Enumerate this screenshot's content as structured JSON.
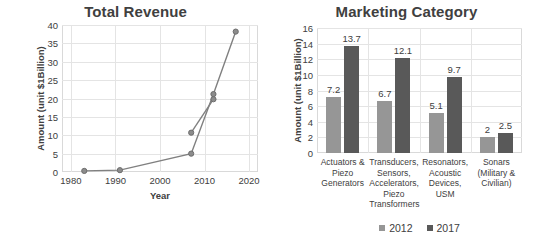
{
  "chart_data": [
    {
      "type": "line",
      "title": "Total Revenue",
      "xlabel": "Year",
      "ylabel": "Amount (unit $1Billion)",
      "xlim": [
        1978,
        2022
      ],
      "ylim": [
        0,
        40
      ],
      "yticks": [
        0,
        5,
        10,
        15,
        20,
        25,
        30,
        35,
        40
      ],
      "xticks": [
        1980,
        1990,
        2000,
        2010,
        2020
      ],
      "grid": true,
      "legend": "none",
      "marker": "circle",
      "line_color": "#808080",
      "series": [
        {
          "name": "series-1",
          "points": [
            {
              "x": 1983,
              "y": 0.3
            },
            {
              "x": 1991,
              "y": 0.5
            },
            {
              "x": 2007,
              "y": 5.0
            },
            {
              "x": 2012,
              "y": 21.2
            },
            {
              "x": 2017,
              "y": 38.2
            }
          ]
        },
        {
          "name": "series-2",
          "points": [
            {
              "x": 2007,
              "y": 10.7
            },
            {
              "x": 2012,
              "y": 19.8
            }
          ]
        }
      ]
    },
    {
      "type": "bar",
      "title": "Marketing Category",
      "xlabel": "",
      "ylabel": "Amount (unit $1Billion)",
      "ylim": [
        0,
        16
      ],
      "yticks": [
        0,
        2,
        4,
        6,
        8,
        10,
        12,
        14,
        16
      ],
      "grid": true,
      "legend": "bottom",
      "categories": [
        "Actuators & Piezo Generators",
        "Transducers, Sensors, Accelerators, Piezo Transformers",
        "Resonators, Acoustic Devices, USM",
        "Sonars (Military & Civilian)"
      ],
      "series": [
        {
          "name": "2012",
          "color": "#969696",
          "values": [
            7.2,
            6.7,
            5.1,
            2
          ]
        },
        {
          "name": "2017",
          "color": "#595959",
          "values": [
            13.7,
            12.1,
            9.7,
            2.5
          ]
        }
      ],
      "value_labels": [
        [
          "7.2",
          "6.7",
          "5.1",
          "2"
        ],
        [
          "13.7",
          "12.1",
          "9.7",
          "2.5"
        ]
      ]
    }
  ]
}
